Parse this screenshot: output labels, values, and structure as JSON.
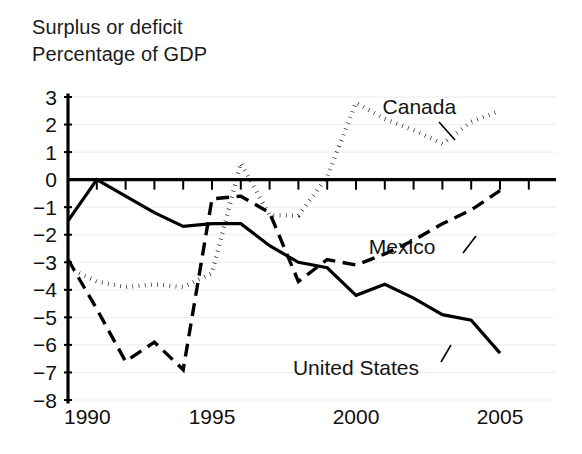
{
  "figure": {
    "title_lines": [
      "Surplus or deficit",
      "Percentage of GDP"
    ]
  },
  "chart_data": {
    "type": "line",
    "title": "Surplus or deficit Percentage of GDP",
    "subtitle": "Percentage of GDP",
    "xlabel": "",
    "ylabel": "Percentage of GDP",
    "xlim": [
      1990,
      2005
    ],
    "ylim": [
      -8,
      3
    ],
    "ytick_step": 1,
    "grid": true,
    "grid_axis": "y",
    "legend_position": "inline-annotations",
    "x": [
      1990,
      1991,
      1992,
      1993,
      1994,
      1995,
      1996,
      1997,
      1998,
      1999,
      2000,
      2001,
      2002,
      2003,
      2004,
      2005
    ],
    "xticks": [
      1990,
      1995,
      2000,
      2005
    ],
    "xtick_labels": [
      "1990",
      "1995",
      "2000",
      "2005"
    ],
    "yticks": [
      3,
      2,
      1,
      0,
      -1,
      -2,
      -3,
      -4,
      -5,
      -6,
      -7,
      -8
    ],
    "ytick_labels": [
      "3",
      "2",
      "1",
      "0",
      "−1",
      "−2",
      "−3",
      "−4",
      "−5",
      "−6",
      "−7",
      "−8"
    ],
    "series": [
      {
        "name": "Canada",
        "label": "Canada",
        "linestyle": "dotted",
        "color": "#000000",
        "values": [
          -3.2,
          -3.7,
          -3.9,
          -3.8,
          -3.9,
          -3.4,
          0.6,
          -1.3,
          -1.3,
          0.1,
          2.8,
          2.2,
          1.8,
          1.3,
          2.1,
          2.5
        ]
      },
      {
        "name": "Mexico",
        "label": "Mexico",
        "linestyle": "dashed",
        "color": "#000000",
        "values": [
          -2.9,
          -4.7,
          -6.6,
          -5.9,
          -6.9,
          -0.7,
          -0.6,
          -1.2,
          -3.7,
          -2.9,
          -3.1,
          -2.7,
          -2.2,
          -1.6,
          -1.1,
          -0.4
        ]
      },
      {
        "name": "United States",
        "label": "United States",
        "linestyle": "solid",
        "color": "#000000",
        "values": [
          -1.5,
          0.0,
          -0.6,
          -1.2,
          -1.7,
          -1.6,
          -1.6,
          -2.4,
          -3.0,
          -3.2,
          -4.2,
          -3.8,
          -4.3,
          -4.9,
          -5.1,
          -6.3
        ]
      }
    ],
    "annotations": [
      {
        "text": "Canada",
        "x": 2002.2,
        "y": 2.65
      },
      {
        "text": "Mexico",
        "x": 2001.6,
        "y": -2.45
      },
      {
        "text": "United States",
        "x": 2000.0,
        "y": -6.85
      }
    ]
  }
}
